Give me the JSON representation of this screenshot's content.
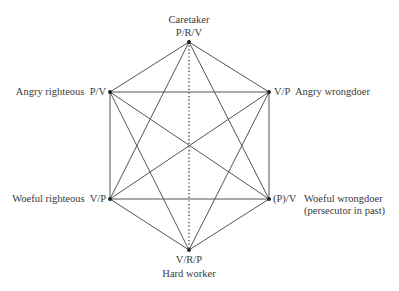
{
  "diagram": {
    "type": "hexagram-role-diagram",
    "nodes": {
      "top": {
        "role": "Caretaker",
        "code": "P/R/V",
        "x": 189,
        "y": 42
      },
      "ul": {
        "role": "Angry righteous",
        "code": "P/V",
        "x": 110,
        "y": 92
      },
      "ur": {
        "role": "Angry wrongdoer",
        "code": "V/P",
        "x": 269,
        "y": 92
      },
      "ll": {
        "role": "Woeful righteous",
        "code": "V/P",
        "x": 110,
        "y": 199
      },
      "lr": {
        "role": "Woeful wrongdoer",
        "role_note": "(persecutor in past)",
        "code": "(P)/V",
        "x": 269,
        "y": 199
      },
      "bottom": {
        "role": "Hard worker",
        "code": "V/R/P",
        "x": 189,
        "y": 250
      }
    },
    "edges": [
      {
        "from": "top",
        "to": "ul",
        "style": "solid"
      },
      {
        "from": "top",
        "to": "ur",
        "style": "solid"
      },
      {
        "from": "ul",
        "to": "ll",
        "style": "solid"
      },
      {
        "from": "ur",
        "to": "lr",
        "style": "solid"
      },
      {
        "from": "ll",
        "to": "bottom",
        "style": "solid"
      },
      {
        "from": "lr",
        "to": "bottom",
        "style": "solid"
      },
      {
        "from": "ul",
        "to": "ur",
        "style": "solid"
      },
      {
        "from": "ll",
        "to": "lr",
        "style": "solid"
      },
      {
        "from": "top",
        "to": "ll",
        "style": "solid"
      },
      {
        "from": "top",
        "to": "lr",
        "style": "solid"
      },
      {
        "from": "bottom",
        "to": "ul",
        "style": "solid"
      },
      {
        "from": "bottom",
        "to": "ur",
        "style": "solid"
      },
      {
        "from": "ul",
        "to": "lr",
        "style": "solid"
      },
      {
        "from": "ll",
        "to": "ur",
        "style": "solid"
      },
      {
        "from": "top",
        "to": "bottom",
        "style": "dotted"
      }
    ],
    "colors": {
      "line": "#555555",
      "text": "#3a3a3a",
      "node": "#222222"
    }
  }
}
